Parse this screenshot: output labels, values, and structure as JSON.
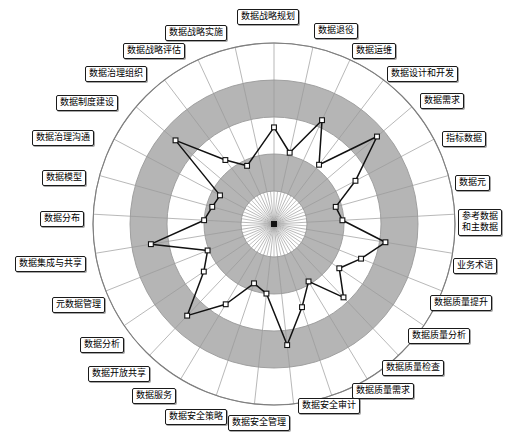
{
  "chart_data": {
    "type": "radar",
    "title": "",
    "subtitle": "",
    "xlabel": "",
    "ylabel": "",
    "grid": true,
    "legend_position": "none",
    "center": {
      "x": 274,
      "y": 224
    },
    "outer_radius": 181,
    "inner_hole_radius": 33,
    "rings": [
      {
        "r_inner": 33,
        "r_outer": 70,
        "fill": "#b5b5b5"
      },
      {
        "r_inner": 70,
        "r_outer": 107,
        "fill": "#ffffff"
      },
      {
        "r_inner": 107,
        "r_outer": 144,
        "fill": "#b5b5b5"
      },
      {
        "r_inner": 144,
        "r_outer": 181,
        "fill": "#ffffff"
      }
    ],
    "band_fill_color": "#b5b5b5",
    "grid_line_color": "#9a9a9a",
    "series_line_color": "#111111",
    "series_marker_fill": "#ffffff",
    "series_marker_stroke": "#111111",
    "value_range": [
      0,
      5
    ],
    "axis_count": 29,
    "categories": [
      "数据战略规划",
      "数据退役",
      "数据运维",
      "数据设计和开发",
      "数据需求",
      "指标数据",
      "数据元",
      "参考数据\n和主数据",
      "业务术语",
      "数据质量提升",
      "数据质量分析",
      "数据质量检查",
      "数据质量需求",
      "数据安全审计",
      "数据安全管理",
      "数据安全策略",
      "数据服务",
      "数据开放共享",
      "数据分析",
      "元数据管理",
      "数据集成与共享",
      "数据分布",
      "数据模型",
      "数据治理沟通",
      "数据制度建设",
      "数据治理组织",
      "数据战略评估",
      "数据战略实施"
    ],
    "series": [
      {
        "name": "成熟度评估",
        "values": [
          2.15,
          1.35,
          2.75,
          1.4,
          3.45,
          2.0,
          1.05,
          1.2,
          2.7,
          2.05,
          1.55,
          2.3,
          1.15,
          1.85,
          3.0,
          1.25,
          1.0,
          2.05,
          3.15,
          1.75,
          1.3,
          3.1,
          1.25,
          1.05,
          0.95,
          3.25,
          1.6,
          1.05
        ]
      }
    ]
  },
  "labels": [
    {
      "text": "数据战略规划",
      "left": 237,
      "top": 9,
      "two_line": false
    },
    {
      "text": "数据退役",
      "left": 314,
      "top": 23,
      "two_line": false
    },
    {
      "text": "数据运维",
      "left": 352,
      "top": 43,
      "two_line": false
    },
    {
      "text": "数据设计和开发",
      "left": 387,
      "top": 66,
      "two_line": false
    },
    {
      "text": "数据需求",
      "left": 420,
      "top": 93,
      "two_line": false
    },
    {
      "text": "指标数据",
      "left": 442,
      "top": 131,
      "two_line": false
    },
    {
      "text": "数据元",
      "left": 455,
      "top": 175,
      "two_line": false
    },
    {
      "text": "参考数据\n和主数据",
      "left": 458,
      "top": 209,
      "two_line": true
    },
    {
      "text": "业务术语",
      "left": 453,
      "top": 258,
      "two_line": false
    },
    {
      "text": "数据质量提升",
      "left": 430,
      "top": 295,
      "two_line": false
    },
    {
      "text": "数据质量分析",
      "left": 408,
      "top": 328,
      "two_line": false
    },
    {
      "text": "数据质量检查",
      "left": 382,
      "top": 360,
      "two_line": false
    },
    {
      "text": "数据质量需求",
      "left": 352,
      "top": 383,
      "two_line": false
    },
    {
      "text": "数据安全审计",
      "left": 298,
      "top": 398,
      "two_line": false
    },
    {
      "text": "数据安全管理",
      "left": 228,
      "top": 415,
      "two_line": false
    },
    {
      "text": "数据安全策略",
      "left": 165,
      "top": 409,
      "two_line": false
    },
    {
      "text": "数据服务",
      "left": 132,
      "top": 388,
      "two_line": false
    },
    {
      "text": "数据开放共享",
      "left": 88,
      "top": 366,
      "two_line": false
    },
    {
      "text": "数据分析",
      "left": 80,
      "top": 337,
      "two_line": false
    },
    {
      "text": "元数据管理",
      "left": 52,
      "top": 297,
      "two_line": false
    },
    {
      "text": "数据集成与共享",
      "left": 15,
      "top": 256,
      "two_line": false
    },
    {
      "text": "数据分布",
      "left": 40,
      "top": 211,
      "two_line": false
    },
    {
      "text": "数据模型",
      "left": 42,
      "top": 170,
      "two_line": false
    },
    {
      "text": "数据治理沟通",
      "left": 32,
      "top": 130,
      "two_line": false
    },
    {
      "text": "数据制度建设",
      "left": 56,
      "top": 95,
      "two_line": false
    },
    {
      "text": "数据治理组织",
      "left": 85,
      "top": 66,
      "two_line": false
    },
    {
      "text": "数据战略评估",
      "left": 123,
      "top": 43,
      "two_line": false
    },
    {
      "text": "数据战略实施",
      "left": 165,
      "top": 25,
      "two_line": false
    }
  ]
}
